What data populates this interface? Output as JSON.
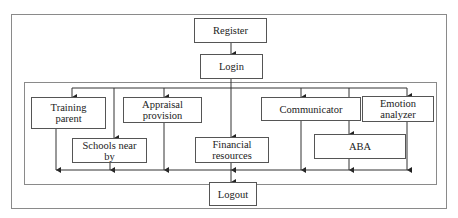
{
  "diagram": {
    "type": "flowchart",
    "nodes": {
      "register": "Register",
      "login": "Login",
      "training_parent": "Training parent",
      "schools_near_by": "Schools near by",
      "appraisal_provision": "Appraisal provision",
      "financial_resources": "Financial resources",
      "communicator": "Communicator",
      "aba": "ABA",
      "emotion_analyzer": "Emotion analyzer",
      "logout": "Logout"
    },
    "labels": {
      "training_parent_l1": "Training",
      "training_parent_l2": "parent",
      "schools_l1": "Schools near",
      "schools_l2": "by",
      "appraisal_l1": "Appraisal",
      "appraisal_l2": "provision",
      "financial_l1": "Financial",
      "financial_l2": "resources",
      "emotion_l1": "Emotion",
      "emotion_l2": "analyzer"
    },
    "edges": [
      [
        "Register",
        "Login"
      ],
      [
        "Login",
        "Training parent"
      ],
      [
        "Login",
        "Schools near by"
      ],
      [
        "Login",
        "Appraisal provision"
      ],
      [
        "Login",
        "Financial resources"
      ],
      [
        "Login",
        "Communicator"
      ],
      [
        "Login",
        "ABA"
      ],
      [
        "Login",
        "Emotion analyzer"
      ],
      [
        "Training parent",
        "Logout"
      ],
      [
        "Schools near by",
        "Logout"
      ],
      [
        "Appraisal provision",
        "Logout"
      ],
      [
        "Financial resources",
        "Logout"
      ],
      [
        "Communicator",
        "Logout"
      ],
      [
        "ABA",
        "Logout"
      ],
      [
        "Emotion analyzer",
        "Logout"
      ]
    ]
  }
}
